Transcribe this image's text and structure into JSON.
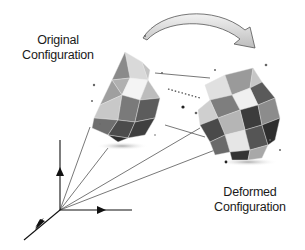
{
  "labels": {
    "original": {
      "line1": "Original",
      "line2": "Configuration"
    },
    "deformed": {
      "line1": "Deformed",
      "line2": "Configuration"
    }
  },
  "elements": {
    "transform_arrow": "curved-arrow-icon",
    "original_shape": "low-poly-polyhedron-original",
    "deformed_shape": "low-poly-polyhedron-deformed",
    "axes": "3d-coordinate-axes"
  },
  "colors": {
    "text": "#1a1a1a",
    "line": "#555555",
    "shape_light": "#e8e8e8",
    "shape_mid": "#9a9a9a",
    "shape_dark": "#3a3a3a"
  }
}
